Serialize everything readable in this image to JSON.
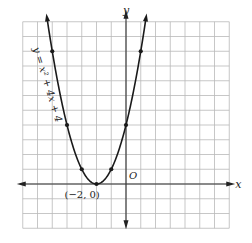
{
  "chart_data": {
    "type": "line",
    "title": "",
    "equation_label": "y = x² + 4x + 4",
    "xlabel": "x",
    "ylabel": "y",
    "origin_label": "O",
    "vertex_label": "(−2, 0)",
    "xlim": [
      -7,
      7
    ],
    "ylim": [
      -3,
      11
    ],
    "grid": true,
    "grid_step": 1,
    "series": [
      {
        "name": "y = x² + 4x + 4",
        "function": "x^2 + 4x + 4",
        "x": [
          -5,
          -4,
          -3,
          -2,
          -1,
          0,
          1
        ],
        "y": [
          9,
          4,
          1,
          0,
          1,
          4,
          9
        ]
      }
    ],
    "marked_points": [
      {
        "x": -5,
        "y": 9
      },
      {
        "x": -4,
        "y": 4
      },
      {
        "x": -3,
        "y": 1
      },
      {
        "x": -2,
        "y": 0
      },
      {
        "x": -1,
        "y": 1
      },
      {
        "x": 0,
        "y": 4
      },
      {
        "x": 1,
        "y": 9
      }
    ],
    "colors": {
      "grid": "#b9b9b9",
      "axis": "#333333",
      "curve": "#1a1a1a"
    }
  }
}
